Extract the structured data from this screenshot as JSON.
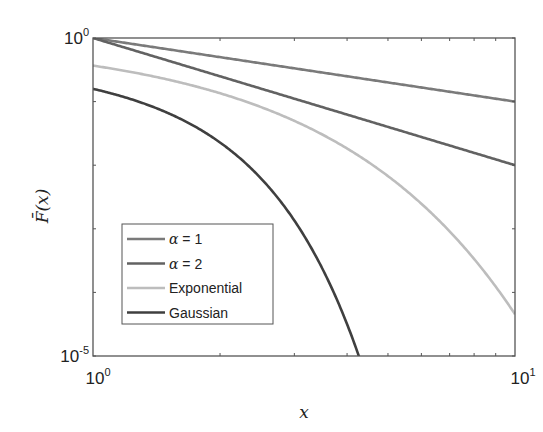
{
  "chart_data": {
    "type": "line",
    "title": "",
    "xlabel": "x",
    "ylabel": "F̄(x)",
    "xscale": "log",
    "yscale": "log",
    "xlim": [
      1,
      10
    ],
    "ylim": [
      1e-05,
      1
    ],
    "x_ticks": [
      {
        "value": 1,
        "base": "10",
        "exp": "0"
      },
      {
        "value": 10,
        "base": "10",
        "exp": "1"
      }
    ],
    "y_ticks": [
      {
        "value": 1,
        "base": "10",
        "exp": "0"
      },
      {
        "value": 1e-05,
        "base": "10",
        "exp": "-5"
      }
    ],
    "grid": false,
    "legend_position": "lower-left",
    "series": [
      {
        "name": "α = 1",
        "legend_symbol": "α",
        "legend_rest": " = 1",
        "color": "#7a7a7a",
        "function": "power",
        "param": 1,
        "x": [
          1,
          2,
          3,
          5,
          10
        ],
        "y": [
          1,
          0.5,
          0.333,
          0.2,
          0.1
        ]
      },
      {
        "name": "α = 2",
        "legend_symbol": "α",
        "legend_rest": " = 2",
        "color": "#626262",
        "function": "power",
        "param": 2,
        "x": [
          1,
          2,
          3,
          5,
          10
        ],
        "y": [
          1,
          0.25,
          0.111,
          0.04,
          0.01
        ]
      },
      {
        "name": "Exponential",
        "legend_symbol": "",
        "legend_rest": "Exponential",
        "color": "#bdbdbd",
        "function": "exp",
        "x": [
          1,
          2,
          3,
          5,
          10
        ],
        "y": [
          0.368,
          0.135,
          0.0498,
          0.00674,
          4.54e-05
        ]
      },
      {
        "name": "Gaussian",
        "legend_symbol": "",
        "legend_rest": "Gaussian",
        "color": "#3f3f3f",
        "function": "gauss_tail",
        "x": [
          1,
          2,
          3,
          4,
          4.26
        ],
        "y": [
          0.159,
          0.0228,
          0.00135,
          3.17e-05,
          1e-05
        ]
      }
    ]
  }
}
